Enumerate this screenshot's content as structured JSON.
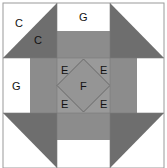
{
  "diagram": {
    "colors": {
      "white": "#ffffff",
      "dark": "#6e6e6e",
      "medium": "#8c8c8c",
      "center": "#9a9a9a",
      "border": "#7a7a7a",
      "diamond": "#6a6a6a"
    },
    "labels": {
      "c_light": "C",
      "c_dark": "C",
      "g_top": "G",
      "g_left": "G",
      "e_top_left": "E",
      "e_top_right": "E",
      "e_bottom_left": "E",
      "e_bottom_right": "E",
      "f_center": "F"
    }
  }
}
